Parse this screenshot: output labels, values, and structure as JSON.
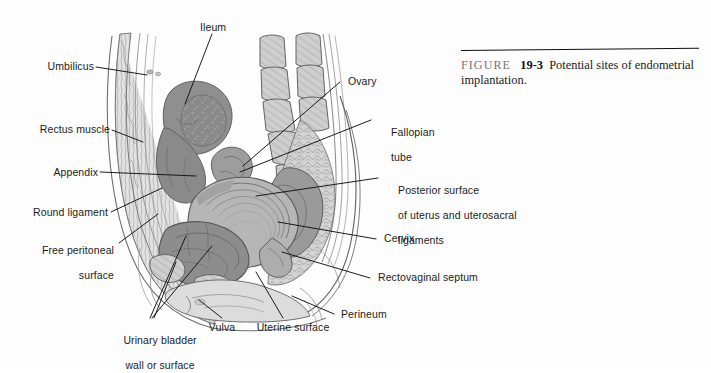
{
  "figure": {
    "caption": {
      "figure_word": "FIGURE",
      "number": "19-3",
      "text": "Potential sites of endometrial implantation."
    }
  },
  "labels": {
    "umbilicus": "Umbilicus",
    "rectus_muscle": "Rectus muscle",
    "appendix": "Appendix",
    "round_ligament": "Round ligament",
    "free_peritoneal_surface_line1": "Free peritoneal",
    "free_peritoneal_surface_line2": "surface",
    "ileum": "Ileum",
    "ovary": "Ovary",
    "fallopian_tube_line1": "Fallopian",
    "fallopian_tube_line2": "tube",
    "posterior_surface_line1": "Posterior surface",
    "posterior_surface_line2": "of uterus and uterosacral",
    "posterior_surface_line3": "ligaments",
    "cervix": "Cervix",
    "rectovaginal_septum": "Rectovaginal septum",
    "perineum": "Perineum",
    "urinary_bladder_line1": "Urinary bladder",
    "urinary_bladder_line2": "wall or surface",
    "vulva": "Vulva",
    "uterine_surface": "Uterine surface"
  },
  "colors": {
    "ink": "#1b1b1b",
    "leader_line": "#111111",
    "tone_light": "#d8d8d8",
    "tone_mid": "#b4b4b4",
    "tone_dark": "#8c8c8c",
    "tone_darkest": "#6e6e6e",
    "caption_gray": "#757575",
    "background": "#fdfdfd"
  }
}
